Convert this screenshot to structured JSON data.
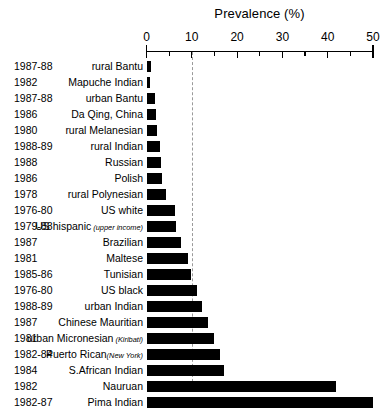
{
  "chart_data": {
    "type": "bar",
    "orientation": "horizontal",
    "title": "Prevalence (%)",
    "xlabel": "Prevalence (%)",
    "ylabel": "",
    "xlim": [
      0,
      50
    ],
    "xticks": [
      0,
      5,
      10,
      15,
      20,
      25,
      30,
      35,
      40,
      45,
      50
    ],
    "xtick_labels": [
      "0",
      "",
      "10",
      "",
      "20",
      "",
      "30",
      "",
      "40",
      "",
      "50"
    ],
    "grid": false,
    "legend": null,
    "reference_line": {
      "value": 10,
      "style": "dashed",
      "color": "#9a9a9a"
    },
    "bar_color": "#000000",
    "categories": [
      "rural Bantu",
      "Mapuche Indian",
      "urban Bantu",
      "Da Qing, China",
      "rural Melanesian",
      "rural Indian",
      "Russian",
      "Polish",
      "rural Polynesian",
      "US white",
      "US hispanic",
      "Brazilian",
      "Maltese",
      "Tunisian",
      "US black",
      "urban Indian",
      "Chinese Mauritian",
      "urban Micronesian",
      "Puerto Rican",
      "S.African Indian",
      "Nauruan",
      "Pima Indian"
    ],
    "values": [
      1.0,
      0.8,
      1.9,
      2.2,
      2.4,
      2.9,
      3.2,
      3.4,
      4.2,
      6.4,
      6.6,
      7.6,
      9.1,
      9.8,
      11.2,
      12.2,
      13.6,
      15.0,
      16.2,
      17.2,
      41.8,
      50.0
    ]
  },
  "chart": {
    "title": "Prevalence (%)",
    "axis": {
      "ticks": [
        {
          "value": 0,
          "label": "0",
          "major": true
        },
        {
          "value": 5,
          "label": "",
          "major": false
        },
        {
          "value": 10,
          "label": "10",
          "major": true
        },
        {
          "value": 15,
          "label": "",
          "major": false
        },
        {
          "value": 20,
          "label": "20",
          "major": true
        },
        {
          "value": 25,
          "label": "",
          "major": false
        },
        {
          "value": 30,
          "label": "30",
          "major": true
        },
        {
          "value": 35,
          "label": "",
          "major": false
        },
        {
          "value": 40,
          "label": "40",
          "major": true
        },
        {
          "value": 45,
          "label": "",
          "major": false
        },
        {
          "value": 50,
          "label": "50",
          "major": true
        }
      ]
    },
    "rows": [
      {
        "year": "1987-88",
        "population": "rural Bantu",
        "note": "",
        "value": 1.0
      },
      {
        "year": "1982",
        "population": "Mapuche Indian",
        "note": "",
        "value": 0.8
      },
      {
        "year": "1987-88",
        "population": "urban Bantu",
        "note": "",
        "value": 1.9
      },
      {
        "year": "1986",
        "population": "Da Qing, China",
        "note": "",
        "value": 2.2
      },
      {
        "year": "1980",
        "population": "rural Melanesian",
        "note": "",
        "value": 2.4
      },
      {
        "year": "1988-89",
        "population": "rural Indian",
        "note": "",
        "value": 2.9
      },
      {
        "year": "1988",
        "population": "Russian",
        "note": "",
        "value": 3.2
      },
      {
        "year": "1986",
        "population": "Polish",
        "note": "",
        "value": 3.4
      },
      {
        "year": "1978",
        "population": "rural Polynesian",
        "note": "",
        "value": 4.2
      },
      {
        "year": "1976-80",
        "population": "US white",
        "note": "",
        "value": 6.4
      },
      {
        "year": "1979-88",
        "population": "US hispanic",
        "note": "(upper income)",
        "value": 6.6
      },
      {
        "year": "1987",
        "population": "Brazilian",
        "note": "",
        "value": 7.6
      },
      {
        "year": "1981",
        "population": "Maltese",
        "note": "",
        "value": 9.1
      },
      {
        "year": "1985-86",
        "population": "Tunisian",
        "note": "",
        "value": 9.8
      },
      {
        "year": "1976-80",
        "population": "US black",
        "note": "",
        "value": 11.2
      },
      {
        "year": "1988-89",
        "population": "urban Indian",
        "note": "",
        "value": 12.2
      },
      {
        "year": "1987",
        "population": "Chinese Mauritian",
        "note": "",
        "value": 13.6
      },
      {
        "year": "1981",
        "population": "urban Micronesian",
        "note": "(Kiribati)",
        "value": 15.0
      },
      {
        "year": "1982-84",
        "population": "Puerto Rican",
        "note": "(New York)",
        "value": 16.2
      },
      {
        "year": "1984",
        "population": "S.African Indian",
        "note": "",
        "value": 17.2
      },
      {
        "year": "1982",
        "population": "Nauruan",
        "note": "",
        "value": 41.8
      },
      {
        "year": "1982-87",
        "population": "Pima Indian",
        "note": "",
        "value": 50.0
      }
    ]
  }
}
